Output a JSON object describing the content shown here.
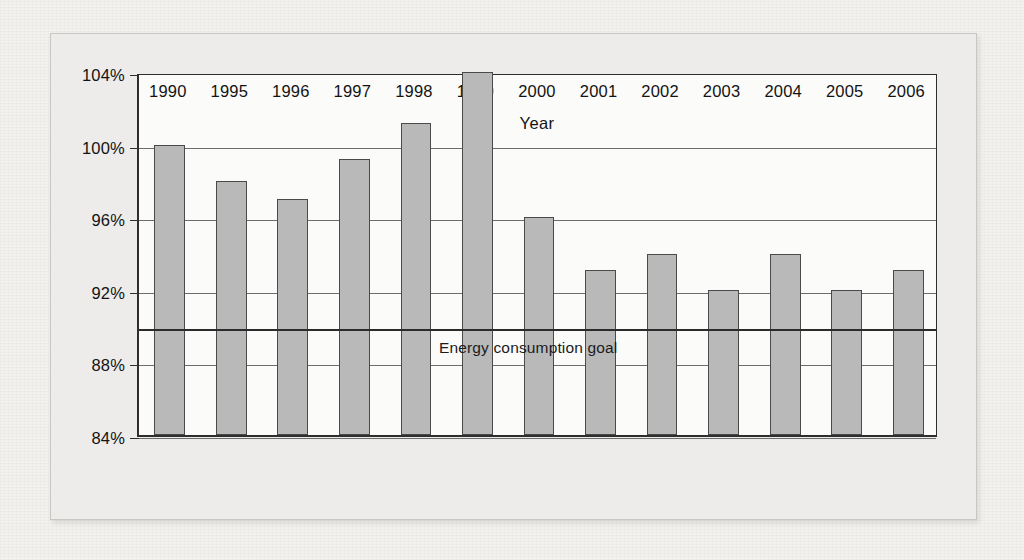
{
  "figure": {
    "background_color": "#f2f1ee",
    "plot_background_color": "#fbfbfa",
    "bar_fill_color": "#b9b9b9",
    "bar_edge_color": "#4a4a4a",
    "axis_color": "#2e2e2e",
    "gridline_color": "#6d6d6d",
    "goal_line_color": "#2b2b2b"
  },
  "ghost_text": {
    "line1": "the reverse side of the printed page",
    "line2": "faint show-through text"
  },
  "chart_data": {
    "type": "bar",
    "title": "",
    "xlabel": "Year",
    "ylabel": "",
    "categories": [
      "1990",
      "1995",
      "1996",
      "1997",
      "1998",
      "1999",
      "2000",
      "2001",
      "2002",
      "2003",
      "2004",
      "2005",
      "2006"
    ],
    "values": [
      100.0,
      98.0,
      97.0,
      99.2,
      101.2,
      104.0,
      96.0,
      93.1,
      94.0,
      92.0,
      94.0,
      92.0,
      93.1
    ],
    "ylim": [
      84,
      104
    ],
    "ytick_values": [
      84,
      88,
      92,
      96,
      100,
      104
    ],
    "ytick_labels": [
      "84%",
      "88%",
      "92%",
      "96%",
      "100%",
      "104%"
    ],
    "grid": true,
    "grid_axis": "y",
    "legend": false,
    "annotations": [
      {
        "name": "energy-consumption-goal",
        "label": "Energy consumption goal",
        "type": "hline",
        "value": 90
      }
    ]
  }
}
